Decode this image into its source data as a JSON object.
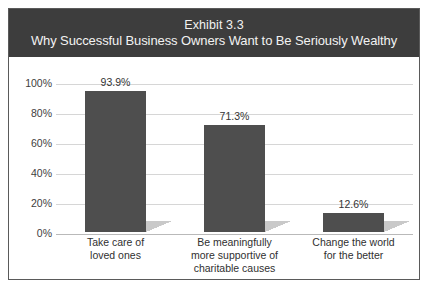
{
  "header": {
    "exhibit": "Exhibit 3.3",
    "title": "Why Successful Business Owners Want to Be Seriously Wealthy"
  },
  "colors": {
    "header_background": "#3d3d3d",
    "header_text": "#f2f2f2",
    "bar_fill": "#4e4e4e",
    "bar_shadow": "#c9c9c9",
    "gridline": "#d6d6d6",
    "frame_border": "#5a5a5a",
    "plot_background": "#ffffff"
  },
  "chart_data": {
    "type": "bar",
    "title": "Why Successful Business Owners Want to Be Seriously Wealthy",
    "subtitle": "Exhibit 3.3",
    "xlabel": "",
    "ylabel": "",
    "ylim": [
      0,
      100
    ],
    "grid": true,
    "legend": false,
    "categories": [
      "Take care of loved ones",
      "Be meaningfully more supportive of charitable causes",
      "Change the world for the better"
    ],
    "category_lines": [
      [
        "Take care of",
        "loved ones"
      ],
      [
        "Be meaningfully",
        "more supportive of",
        "charitable causes"
      ],
      [
        "Change the world",
        "for the better"
      ]
    ],
    "values": [
      93.9,
      71.3,
      12.6
    ],
    "value_labels": [
      "93.9%",
      "71.3%",
      "12.6%"
    ],
    "y_ticks": [
      0,
      20,
      40,
      60,
      80,
      100
    ],
    "y_tick_labels": [
      "0%",
      "20%",
      "40%",
      "60%",
      "80%",
      "100%"
    ]
  }
}
